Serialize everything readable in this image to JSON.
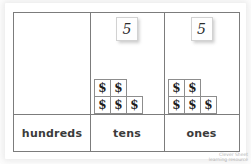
{
  "worksheet": {
    "title": "Place Value Chart",
    "watermark": "watermark-logo"
  },
  "chart": {
    "columns": [
      {
        "key": "hundreds",
        "label": "hundreds",
        "digit": "",
        "has_digit": false,
        "tile_rows": []
      },
      {
        "key": "tens",
        "label": "tens",
        "digit": "5",
        "has_digit": true,
        "tile_rows": [
          {
            "count": 2,
            "symbols": [
              "$",
              "$"
            ]
          },
          {
            "count": 3,
            "symbols": [
              "$",
              "$",
              "$"
            ]
          }
        ]
      },
      {
        "key": "ones",
        "label": "ones",
        "digit": "5",
        "has_digit": true,
        "tile_rows": [
          {
            "count": 2,
            "symbols": [
              "$",
              "$"
            ]
          },
          {
            "count": 3,
            "symbols": [
              "$",
              "$",
              "$"
            ]
          }
        ]
      }
    ],
    "tile_symbol": "$",
    "colors": {
      "frame_line": "#7c7c7c",
      "tile_border": "#8d8d8d",
      "label_text": "#3b3b3b",
      "digit_text": "#2b2b2b",
      "paper": "#ffffff"
    }
  }
}
